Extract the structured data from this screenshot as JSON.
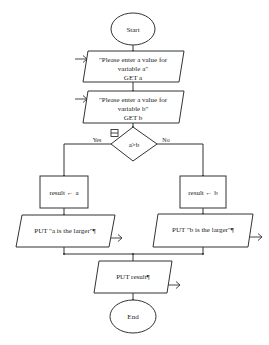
{
  "flowchart": {
    "start": {
      "label": "Start"
    },
    "input_a": {
      "lines": [
        "\"Please enter a value for",
        "variable a\"",
        "GET a"
      ]
    },
    "input_b": {
      "lines": [
        "\"Please enter a value for",
        "variable b\"",
        "GET b"
      ]
    },
    "decision": {
      "label": "a>b",
      "yes_label": "Yes",
      "no_label": "No",
      "collapse_icon": "minus-box-icon"
    },
    "assign_a": {
      "label": "result ← a"
    },
    "assign_b": {
      "label": "result ← b"
    },
    "output_a": {
      "label": "PUT \"a is the larger\"¶"
    },
    "output_b": {
      "label": "PUT \"b is the larger\"¶"
    },
    "output_result": {
      "label": "PUT result¶"
    },
    "end": {
      "label": "End"
    }
  },
  "colors": {
    "stroke": "#333333",
    "background": "#ffffff",
    "text": "#222222"
  }
}
